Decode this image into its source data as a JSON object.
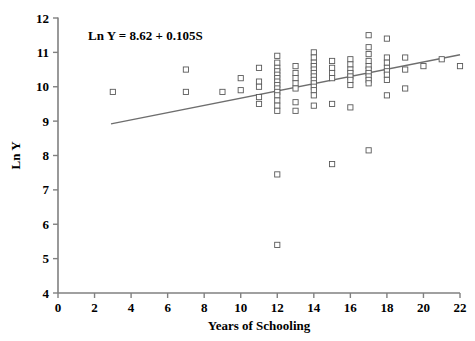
{
  "chart_data": {
    "type": "scatter",
    "title": "",
    "annotation": "Ln Y = 8.62 + 0.105S",
    "xlabel": "Years of Schooling",
    "ylabel": "Ln Y",
    "xlim": [
      0,
      22
    ],
    "ylim": [
      4,
      12
    ],
    "xticks": [
      0,
      2,
      4,
      6,
      8,
      10,
      12,
      14,
      16,
      18,
      20,
      22
    ],
    "yticks": [
      4,
      5,
      6,
      7,
      8,
      9,
      10,
      11,
      12
    ],
    "grid": false,
    "legend": null,
    "marker_style": "open-square",
    "marker_color": "#5a5a5a",
    "fit_line": {
      "label": "Ln Y = 8.62 + 0.105S",
      "intercept": 8.62,
      "slope": 0.105,
      "x_start": 2.9,
      "x_end": 22.0,
      "y_start": 8.92,
      "y_end": 10.93,
      "color": "#6e6e6e"
    },
    "points": [
      {
        "x": 3,
        "y": 9.85
      },
      {
        "x": 7,
        "y": 9.85
      },
      {
        "x": 7,
        "y": 10.5
      },
      {
        "x": 9,
        "y": 9.85
      },
      {
        "x": 10,
        "y": 9.9
      },
      {
        "x": 10,
        "y": 10.25
      },
      {
        "x": 11,
        "y": 10.55
      },
      {
        "x": 11,
        "y": 10.15
      },
      {
        "x": 11,
        "y": 10.0
      },
      {
        "x": 11,
        "y": 9.7
      },
      {
        "x": 11,
        "y": 9.5
      },
      {
        "x": 12,
        "y": 10.9
      },
      {
        "x": 12,
        "y": 10.7
      },
      {
        "x": 12,
        "y": 10.55
      },
      {
        "x": 12,
        "y": 10.45
      },
      {
        "x": 12,
        "y": 10.35
      },
      {
        "x": 12,
        "y": 10.25
      },
      {
        "x": 12,
        "y": 10.15
      },
      {
        "x": 12,
        "y": 10.05
      },
      {
        "x": 12,
        "y": 9.95
      },
      {
        "x": 12,
        "y": 9.85
      },
      {
        "x": 12,
        "y": 9.75
      },
      {
        "x": 12,
        "y": 9.6
      },
      {
        "x": 12,
        "y": 9.45
      },
      {
        "x": 12,
        "y": 9.3
      },
      {
        "x": 12,
        "y": 7.45
      },
      {
        "x": 12,
        "y": 5.4
      },
      {
        "x": 13,
        "y": 10.6
      },
      {
        "x": 13,
        "y": 10.4
      },
      {
        "x": 13,
        "y": 10.25
      },
      {
        "x": 13,
        "y": 10.1
      },
      {
        "x": 13,
        "y": 9.95
      },
      {
        "x": 13,
        "y": 9.55
      },
      {
        "x": 13,
        "y": 9.3
      },
      {
        "x": 14,
        "y": 11.0
      },
      {
        "x": 14,
        "y": 10.85
      },
      {
        "x": 14,
        "y": 10.7
      },
      {
        "x": 14,
        "y": 10.6
      },
      {
        "x": 14,
        "y": 10.5
      },
      {
        "x": 14,
        "y": 10.4
      },
      {
        "x": 14,
        "y": 10.3
      },
      {
        "x": 14,
        "y": 10.2
      },
      {
        "x": 14,
        "y": 10.1
      },
      {
        "x": 14,
        "y": 10.0
      },
      {
        "x": 14,
        "y": 9.9
      },
      {
        "x": 14,
        "y": 9.75
      },
      {
        "x": 14,
        "y": 9.45
      },
      {
        "x": 15,
        "y": 10.75
      },
      {
        "x": 15,
        "y": 10.55
      },
      {
        "x": 15,
        "y": 10.4
      },
      {
        "x": 15,
        "y": 10.25
      },
      {
        "x": 15,
        "y": 9.5
      },
      {
        "x": 15,
        "y": 7.75
      },
      {
        "x": 16,
        "y": 10.8
      },
      {
        "x": 16,
        "y": 10.65
      },
      {
        "x": 16,
        "y": 10.5
      },
      {
        "x": 16,
        "y": 10.4
      },
      {
        "x": 16,
        "y": 10.3
      },
      {
        "x": 16,
        "y": 10.2
      },
      {
        "x": 16,
        "y": 10.05
      },
      {
        "x": 16,
        "y": 9.4
      },
      {
        "x": 17,
        "y": 11.5
      },
      {
        "x": 17,
        "y": 11.15
      },
      {
        "x": 17,
        "y": 10.95
      },
      {
        "x": 17,
        "y": 10.75
      },
      {
        "x": 17,
        "y": 10.6
      },
      {
        "x": 17,
        "y": 10.5
      },
      {
        "x": 17,
        "y": 10.4
      },
      {
        "x": 17,
        "y": 10.3
      },
      {
        "x": 17,
        "y": 10.2
      },
      {
        "x": 17,
        "y": 10.1
      },
      {
        "x": 17,
        "y": 8.15
      },
      {
        "x": 18,
        "y": 11.4
      },
      {
        "x": 18,
        "y": 10.85
      },
      {
        "x": 18,
        "y": 10.7
      },
      {
        "x": 18,
        "y": 10.55
      },
      {
        "x": 18,
        "y": 10.45
      },
      {
        "x": 18,
        "y": 10.35
      },
      {
        "x": 18,
        "y": 10.2
      },
      {
        "x": 18,
        "y": 9.75
      },
      {
        "x": 19,
        "y": 10.85
      },
      {
        "x": 19,
        "y": 10.5
      },
      {
        "x": 19,
        "y": 9.95
      },
      {
        "x": 20,
        "y": 10.6
      },
      {
        "x": 21,
        "y": 10.8
      },
      {
        "x": 22,
        "y": 10.6
      }
    ]
  }
}
